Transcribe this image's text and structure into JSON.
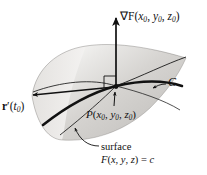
{
  "figure": {
    "background_color": "#ffffff",
    "ink_color": "#111111",
    "surface_fill_light": "#f2f1ef",
    "surface_fill_mid": "#d8d6d3",
    "surface_fill_dark": "#b9b7b4"
  },
  "labels": {
    "gradient": {
      "symbol": "∇F",
      "open": "(",
      "x": "x",
      "x_sub": "0",
      "comma1": ", ",
      "y": "y",
      "y_sub": "0",
      "comma2": ", ",
      "z": "z",
      "z_sub": "0",
      "close": ")",
      "full_text": "∇F(x0, y0, z0)"
    },
    "tangent_vector": {
      "symbol": "r",
      "prime": "′",
      "open": "(",
      "t": "t",
      "t_sub": "0",
      "close": ")",
      "full_text": "r′(t0)"
    },
    "curve": {
      "name": "C",
      "full_text": "C"
    },
    "point": {
      "symbol": "P",
      "open": "(",
      "x": "x",
      "x_sub": "0",
      "comma1": ", ",
      "y": "y",
      "y_sub": "0",
      "comma2": ", ",
      "z": "z",
      "z_sub": "0",
      "close": ")",
      "full_text": "P(x0, y0, z0)"
    },
    "surface": {
      "line1": "surface",
      "eq_f": "F",
      "eq_open": "(",
      "eq_x": "x",
      "eq_comma1": ", ",
      "eq_y": "y",
      "eq_comma2": ", ",
      "eq_z": "z",
      "eq_close": ")",
      "eq_equals": " = ",
      "eq_c": "c",
      "line2_full": "F(x, y, z) = c"
    }
  },
  "annotations": {
    "right_angle_marker": "right angle between gradient and tangent plane",
    "gradient_arrow_direction": "up",
    "tangent_arrow_direction": "left",
    "point_arrow_direction": "up",
    "surface_leader_direction": "up-left curved"
  }
}
